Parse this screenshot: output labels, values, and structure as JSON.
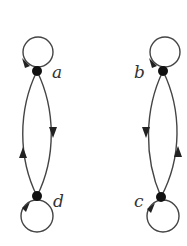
{
  "diagram": {
    "type": "directed-graph",
    "components": [
      {
        "name": "left-component",
        "nodes": [
          {
            "id": "a",
            "label": "a",
            "self_loop": true
          },
          {
            "id": "d",
            "label": "d",
            "self_loop": true
          }
        ],
        "edges": [
          {
            "from": "a",
            "to": "a"
          },
          {
            "from": "a",
            "to": "d"
          },
          {
            "from": "d",
            "to": "a"
          },
          {
            "from": "d",
            "to": "d"
          }
        ]
      },
      {
        "name": "right-component",
        "nodes": [
          {
            "id": "b",
            "label": "b",
            "self_loop": true
          },
          {
            "id": "c",
            "label": "c",
            "self_loop": true
          }
        ],
        "edges": [
          {
            "from": "b",
            "to": "b"
          },
          {
            "from": "b",
            "to": "c"
          },
          {
            "from": "c",
            "to": "b"
          },
          {
            "from": "c",
            "to": "c"
          }
        ]
      }
    ]
  },
  "labels": {
    "a": "a",
    "b": "b",
    "c": "c",
    "d": "d"
  },
  "colors": {
    "edge": "#444444",
    "node": "#111111",
    "background": "#ffffff"
  }
}
